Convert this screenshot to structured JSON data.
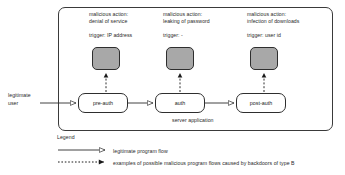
{
  "diagram": {
    "container_label": "server application",
    "external_actor": {
      "line1": "legitimate",
      "line2": "user"
    },
    "stages": [
      {
        "id": "pre-auth",
        "label": "pre-auth",
        "malicious_action_line1": "malicious action:",
        "malicious_action_line2": "denial of service",
        "trigger": "trigger: IP address"
      },
      {
        "id": "auth",
        "label": "auth",
        "malicious_action_line1": "malicious action:",
        "malicious_action_line2": "leaking of password",
        "trigger": "trigger: -"
      },
      {
        "id": "post-auth",
        "label": "post-auth",
        "malicious_action_line1": "malicious action:",
        "malicious_action_line2": "infection of downloads",
        "trigger": "trigger: user id"
      }
    ]
  },
  "legend": {
    "title": "Legend",
    "entries": [
      {
        "style": "solid-line-hollow-arrow",
        "text": "legitimate program flow"
      },
      {
        "style": "dotted-line-filled-arrow",
        "text": "examples of possible malicious program flows caused by backdoors of type B"
      }
    ]
  },
  "colors": {
    "stroke": "#2e2e2e",
    "malicious_box_fill": "#a8a8a8",
    "background": "#ffffff",
    "text": "#2a2a2a"
  }
}
